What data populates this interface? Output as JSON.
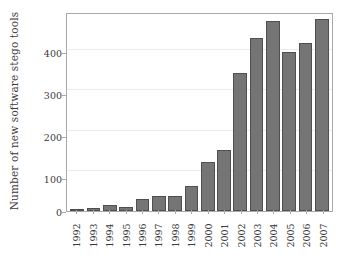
{
  "chart_data": {
    "type": "bar",
    "title": "",
    "xlabel": "",
    "ylabel": "Number of new software stego tools",
    "categories": [
      "1992",
      "1993",
      "1994",
      "1995",
      "1996",
      "1997",
      "1998",
      "1999",
      "2000",
      "2001",
      "2002",
      "2003",
      "2004",
      "2005",
      "2006",
      "2007"
    ],
    "values": [
      2,
      7,
      15,
      11,
      29,
      37,
      38,
      62,
      121,
      149,
      339,
      426,
      468,
      392,
      414,
      472
    ],
    "ylim": [
      0,
      485
    ],
    "yticks": [
      0,
      100,
      200,
      300,
      400
    ],
    "ytick_labels": [
      "0",
      "100",
      "200",
      "300",
      "400"
    ],
    "grid": true,
    "grid_axis": "y",
    "legend": null,
    "colors": {
      "bar_fill": "#757575",
      "bar_edge": "#4f4f4f",
      "axis": "#a9a9a9",
      "grid": "#ececec",
      "text": "#3a3a3a",
      "background": "#ffffff"
    }
  }
}
